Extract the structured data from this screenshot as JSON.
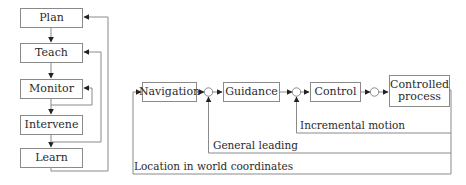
{
  "left_diagram": {
    "steps": [
      {
        "label": "Plan"
      },
      {
        "label": "Teach"
      },
      {
        "label": "Monitor"
      },
      {
        "label": "Intervene"
      },
      {
        "label": "Learn"
      }
    ],
    "edges": [
      {
        "from": "Plan",
        "to": "Teach"
      },
      {
        "from": "Teach",
        "to": "Monitor"
      },
      {
        "from": "Monitor",
        "to": "Intervene"
      },
      {
        "from": "Intervene",
        "to": "Learn"
      },
      {
        "from": "Monitor",
        "to": "Monitor",
        "type": "feedback"
      },
      {
        "from": "Intervene",
        "to": "Teach",
        "type": "feedback"
      },
      {
        "from": "Learn",
        "to": "Plan",
        "type": "feedback"
      }
    ]
  },
  "right_diagram": {
    "blocks": [
      {
        "label": "Navigation"
      },
      {
        "label": "Guidance"
      },
      {
        "label": "Control"
      },
      {
        "label": "Controlled process"
      }
    ],
    "feedback_labels": {
      "incremental": "Incremental motion",
      "general": "General leading",
      "location": "Location in world coordinates"
    },
    "summing_junctions": 3
  },
  "colors": {
    "line": "#8a8a8a",
    "arrow": "#222222",
    "text": "#2a2a2a"
  }
}
